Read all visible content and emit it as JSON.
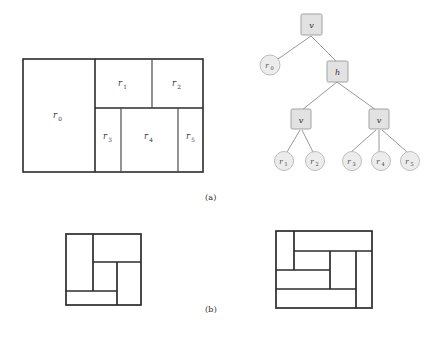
{
  "figure": {
    "captions": [
      {
        "id": "a",
        "text": "(a)"
      },
      {
        "id": "b",
        "text": "(b)"
      }
    ],
    "colors": {
      "stroke": "#2b2b2b",
      "thin_stroke": "#4a4a4a",
      "node_fill": "#e2e2e2",
      "node_stroke": "#9a9a9a",
      "leaf_fill": "#ececec",
      "leaf_stroke": "#b5b5b5",
      "edge": "#8c8c8c",
      "background": "#ffffff",
      "text": "#2b2b2b"
    },
    "floorplan_main": {
      "name": "slicing-floorplan",
      "frame": {
        "x": 23,
        "y": 59,
        "w": 180,
        "h": 113
      },
      "rooms": [
        {
          "id": "r0",
          "label": "r",
          "sub": "0",
          "x": 23,
          "y": 59,
          "w": 72,
          "h": 113
        },
        {
          "id": "r1",
          "label": "r",
          "sub": "1",
          "x": 95,
          "y": 59,
          "w": 57,
          "h": 49
        },
        {
          "id": "r2",
          "label": "r",
          "sub": "2",
          "x": 152,
          "y": 59,
          "w": 51,
          "h": 49
        },
        {
          "id": "r3",
          "label": "r",
          "sub": "3",
          "x": 95,
          "y": 108,
          "w": 26,
          "h": 64
        },
        {
          "id": "r4",
          "label": "r",
          "sub": "4",
          "x": 121,
          "y": 108,
          "w": 57,
          "h": 64
        },
        {
          "id": "r5",
          "label": "r",
          "sub": "5",
          "x": 178,
          "y": 108,
          "w": 25,
          "h": 64
        }
      ]
    },
    "slicing_tree": {
      "name": "slicing-tree",
      "nodes": [
        {
          "id": "n-root",
          "kind": "internal",
          "label": "v",
          "x": 311,
          "y": 24
        },
        {
          "id": "n-r0",
          "kind": "leaf",
          "label": "r",
          "sub": "0",
          "x": 276,
          "y": 65
        },
        {
          "id": "n-h",
          "kind": "internal",
          "label": "h",
          "x": 337,
          "y": 70
        },
        {
          "id": "n-v-left",
          "kind": "internal",
          "label": "v",
          "x": 300,
          "y": 118
        },
        {
          "id": "n-v-right",
          "kind": "internal",
          "label": "v",
          "x": 378,
          "y": 118
        },
        {
          "id": "n-r1",
          "kind": "leaf",
          "label": "r",
          "sub": "1",
          "x": 285,
          "y": 158
        },
        {
          "id": "n-r2",
          "kind": "leaf",
          "label": "r",
          "sub": "2",
          "x": 313,
          "y": 158
        },
        {
          "id": "n-r3",
          "kind": "leaf",
          "label": "r",
          "sub": "3",
          "x": 349,
          "y": 158
        },
        {
          "id": "n-r4",
          "kind": "leaf",
          "label": "r",
          "sub": "4",
          "x": 379,
          "y": 158
        },
        {
          "id": "n-r5",
          "kind": "leaf",
          "label": "r",
          "sub": "5",
          "x": 409,
          "y": 158
        }
      ],
      "edges": [
        {
          "from": "n-root",
          "to": "n-r0"
        },
        {
          "from": "n-root",
          "to": "n-h"
        },
        {
          "from": "n-h",
          "to": "n-v-left"
        },
        {
          "from": "n-h",
          "to": "n-v-right"
        },
        {
          "from": "n-v-left",
          "to": "n-r1"
        },
        {
          "from": "n-v-left",
          "to": "n-r2"
        },
        {
          "from": "n-v-right",
          "to": "n-r3"
        },
        {
          "from": "n-v-right",
          "to": "n-r4"
        },
        {
          "from": "n-v-right",
          "to": "n-r5"
        }
      ]
    },
    "floorplan_left": {
      "name": "floorplan-variant-left",
      "frame": {
        "x": 66,
        "y": 234,
        "w": 75,
        "h": 71
      },
      "cuts": [
        {
          "orient": "v",
          "x": 93,
          "y1": 234,
          "y2": 291
        },
        {
          "orient": "h",
          "x1": 93,
          "x2": 141,
          "y": 262
        },
        {
          "orient": "v",
          "x": 117,
          "y1": 262,
          "y2": 305
        },
        {
          "orient": "h",
          "x1": 66,
          "x2": 117,
          "y": 291
        }
      ]
    },
    "floorplan_right": {
      "name": "floorplan-variant-right",
      "frame": {
        "x": 276,
        "y": 231,
        "w": 96,
        "h": 77
      },
      "cuts": [
        {
          "orient": "v",
          "x": 294,
          "y1": 231,
          "y2": 270
        },
        {
          "orient": "h",
          "x1": 294,
          "x2": 372,
          "y": 251
        },
        {
          "orient": "v",
          "x": 330,
          "y1": 251,
          "y2": 289
        },
        {
          "orient": "h",
          "x1": 276,
          "x2": 330,
          "y": 270
        },
        {
          "orient": "v",
          "x": 356,
          "y1": 251,
          "y2": 308
        },
        {
          "orient": "h",
          "x1": 276,
          "x2": 356,
          "y": 289
        }
      ]
    }
  }
}
